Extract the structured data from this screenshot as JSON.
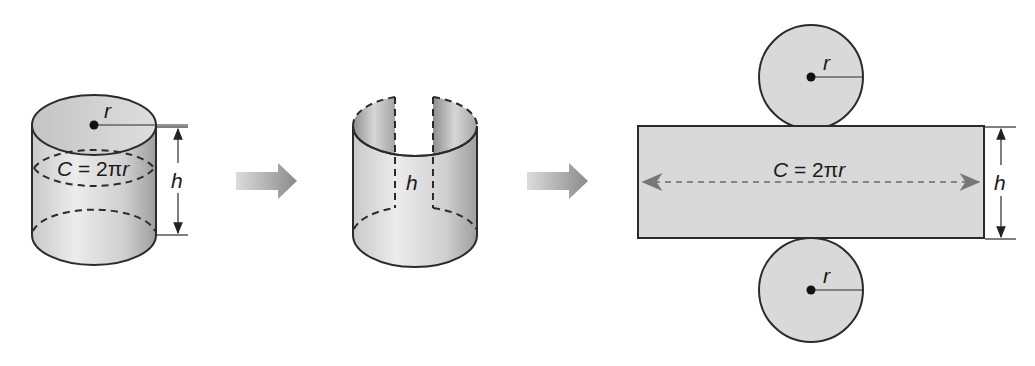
{
  "figure": {
    "steps": [
      {
        "name": "closed-cylinder",
        "labels": {
          "radius": "r",
          "circumference": "C = 2πr",
          "height": "h"
        }
      },
      {
        "name": "cut-cylinder",
        "labels": {
          "height": "h"
        }
      },
      {
        "name": "cylinder-net",
        "labels": {
          "top_radius": "r",
          "circumference": "C = 2πr",
          "height": "h",
          "bottom_radius": "r"
        }
      }
    ],
    "arrows": [
      {
        "from": "closed-cylinder",
        "to": "cut-cylinder"
      },
      {
        "from": "cut-cylinder",
        "to": "cylinder-net"
      }
    ]
  },
  "colors": {
    "background": "#ffffff",
    "stroke": "#2b2b2b",
    "fill_light": "#e4e4e4",
    "fill_dark": "#a8a8a8",
    "net_fill": "#d9d9d9",
    "dim_line": "#555555",
    "arrow_light": "#dcdcdc",
    "arrow_dark": "#8c8c8c"
  }
}
